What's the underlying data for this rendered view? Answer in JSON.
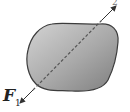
{
  "diagram": {
    "title": "",
    "body": {
      "shape": "rigid-body-blob",
      "fill_light": "#c8c8c8",
      "fill_dark": "#8a8a8a",
      "stroke": "#444444"
    },
    "line_of_action": {
      "style": "dashed-inside-body",
      "color": "#555555"
    },
    "forces": [
      {
        "name": "F",
        "subscript": "1",
        "direction": "down-left"
      },
      {
        "name": "F",
        "subscript": "2",
        "direction": "up-right",
        "visible_text": "2"
      }
    ]
  }
}
